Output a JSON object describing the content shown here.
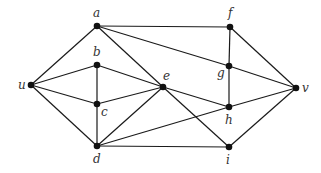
{
  "graph": {
    "nodes": [
      {
        "id": "a",
        "label": "a",
        "x": 97,
        "y": 26,
        "lx": 93,
        "ly": 17
      },
      {
        "id": "f",
        "label": "f",
        "x": 230,
        "y": 27,
        "lx": 228,
        "ly": 17
      },
      {
        "id": "b",
        "label": "b",
        "x": 97,
        "y": 65,
        "lx": 93,
        "ly": 56
      },
      {
        "id": "g",
        "label": "g",
        "x": 229,
        "y": 66,
        "lx": 217,
        "ly": 77
      },
      {
        "id": "u",
        "label": "u",
        "x": 31,
        "y": 85,
        "lx": 18,
        "ly": 89
      },
      {
        "id": "e",
        "label": "e",
        "x": 163,
        "y": 87,
        "lx": 163,
        "ly": 80
      },
      {
        "id": "v",
        "label": "v",
        "x": 296,
        "y": 88,
        "lx": 302,
        "ly": 92
      },
      {
        "id": "c",
        "label": "c",
        "x": 97,
        "y": 104,
        "lx": 101,
        "ly": 116
      },
      {
        "id": "h",
        "label": "h",
        "x": 229,
        "y": 107,
        "lx": 225,
        "ly": 124
      },
      {
        "id": "d",
        "label": "d",
        "x": 97,
        "y": 146,
        "lx": 93,
        "ly": 163
      },
      {
        "id": "i",
        "label": "i",
        "x": 229,
        "y": 147,
        "lx": 226,
        "ly": 164
      }
    ],
    "edges": [
      [
        "u",
        "a"
      ],
      [
        "u",
        "b"
      ],
      [
        "u",
        "c"
      ],
      [
        "u",
        "d"
      ],
      [
        "a",
        "f"
      ],
      [
        "a",
        "g"
      ],
      [
        "a",
        "e"
      ],
      [
        "b",
        "c"
      ],
      [
        "b",
        "e"
      ],
      [
        "c",
        "d"
      ],
      [
        "c",
        "e"
      ],
      [
        "d",
        "e"
      ],
      [
        "d",
        "h"
      ],
      [
        "d",
        "i"
      ],
      [
        "e",
        "h"
      ],
      [
        "e",
        "i"
      ],
      [
        "f",
        "g"
      ],
      [
        "f",
        "v"
      ],
      [
        "g",
        "h"
      ],
      [
        "g",
        "v"
      ],
      [
        "h",
        "v"
      ],
      [
        "i",
        "v"
      ]
    ]
  }
}
